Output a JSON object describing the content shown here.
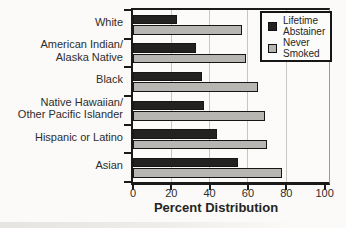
{
  "chart_data": {
    "type": "bar",
    "orientation": "horizontal",
    "title": "",
    "xlabel": "Percent Distribution",
    "ylabel": "",
    "xlim": [
      0,
      100
    ],
    "xticks": [
      0,
      20,
      40,
      60,
      80,
      100
    ],
    "gridlines": [
      20,
      40,
      60,
      80
    ],
    "grid": true,
    "legend_position": "top-right",
    "categories": [
      "White",
      "American Indian/Alaska Native",
      "Black",
      "Native Hawaiian/Other Pacific Islander",
      "Hispanic or Latino",
      "Asian"
    ],
    "category_display_lines": [
      [
        "White"
      ],
      [
        "American Indian/",
        "Alaska Native"
      ],
      [
        "Black"
      ],
      [
        "Native Hawaiian/",
        "Other Pacific Islander"
      ],
      [
        "Hispanic or Latino"
      ],
      [
        "Asian"
      ]
    ],
    "series": [
      {
        "name": "Lifetime Abstainer",
        "color": "#232221",
        "values": [
          23,
          33,
          36,
          37,
          44,
          55
        ]
      },
      {
        "name": "Never Smoked",
        "color": "#b7b6b3",
        "values": [
          57,
          59,
          65,
          69,
          70,
          78
        ]
      }
    ],
    "legend_entries": [
      {
        "label": "Lifetime Abstainer",
        "lines": [
          "Lifetime",
          "Abstainer"
        ],
        "color": "#232221"
      },
      {
        "label": "Never Smoked",
        "lines": [
          "Never",
          "Smoked"
        ],
        "color": "#b7b6b3"
      }
    ]
  },
  "colors": {
    "background": "#fbfaf8",
    "axis": "#1a1a1a",
    "gridline": "#c7c6c2",
    "text": "#2d2d2d"
  }
}
